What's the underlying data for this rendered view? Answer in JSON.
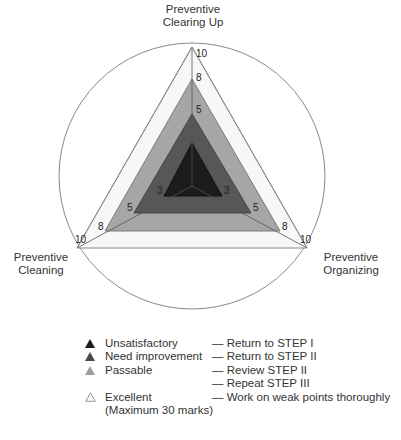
{
  "diagram": {
    "type": "radar-triangle",
    "axes": [
      {
        "id": "top",
        "label_lines": [
          "Preventive",
          "Clearing Up"
        ]
      },
      {
        "id": "left",
        "label_lines": [
          "Preventive",
          "Cleaning"
        ]
      },
      {
        "id": "right",
        "label_lines": [
          "Preventive",
          "Organizing"
        ]
      }
    ],
    "scale_ticks": {
      "top": [
        "10",
        "8",
        "5"
      ],
      "left": [
        "10",
        "8",
        "5",
        "3"
      ],
      "right": [
        "10",
        "8",
        "5",
        "3"
      ]
    },
    "levels": [
      {
        "value": 10,
        "name": "Excellent",
        "fill": "#f7f7f7",
        "stroke": "#8a8a8a"
      },
      {
        "value": 8,
        "name": "Passable",
        "fill": "#a6a6a6",
        "stroke": "#7a7a7a"
      },
      {
        "value": 5,
        "name": "Need improvement",
        "fill": "#575757",
        "stroke": "#444444"
      },
      {
        "value": 3,
        "name": "Unsatisfactory",
        "fill": "#1c1c1c",
        "stroke": "#111111"
      }
    ],
    "circle_stroke": "#8a8a8a"
  },
  "legend": {
    "items": [
      {
        "icon": "filled-triangle-black",
        "color": "#1c1c1c",
        "name": "Unsatisfactory",
        "action": "Return to STEP I"
      },
      {
        "icon": "filled-triangle-darkgray",
        "color": "#4a4a4a",
        "name": "Need improvement",
        "action": "Return to STEP II"
      },
      {
        "icon": "filled-triangle-gray",
        "color": "#9e9e9e",
        "name": "Passable",
        "action": "Review STEP II"
      },
      {
        "icon": "",
        "color": "",
        "name": "",
        "action": "Repeat STEP III"
      },
      {
        "icon": "outline-triangle",
        "color": "#ffffff",
        "name": "Excellent",
        "action": "Work on weak points thoroughly"
      }
    ],
    "excellent_note": "(Maximum 30 marks)"
  }
}
